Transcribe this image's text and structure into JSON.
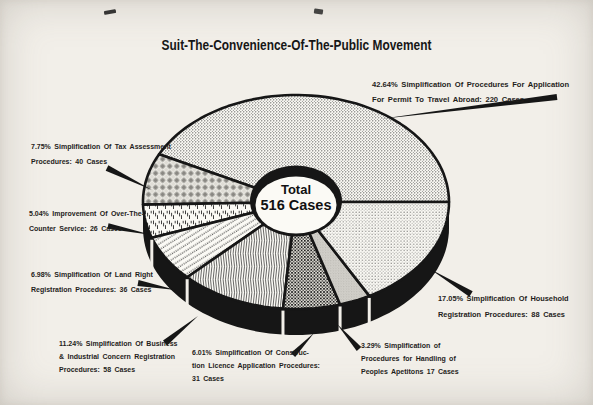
{
  "page": {
    "background": "#f2efe9"
  },
  "chart_data": {
    "type": "pie",
    "title": "Suit-The-Convenience-Of-The-Public Movement",
    "center_label": {
      "line1": "Total",
      "line2": "516 Cases"
    },
    "total_value": 516,
    "units": "Cases",
    "legend_position": "labels-around-pie",
    "colors": {
      "paper": "#f2efe9",
      "pattern_paper": "#fbfaf5",
      "ink": "#161616"
    },
    "geometry": {
      "cx": 296,
      "cy": 202,
      "rx": 153,
      "ry": 107,
      "depth": 26,
      "start_angle": 0,
      "direction": "ccw",
      "hole": {
        "rx_outer": 46,
        "ry_outer": 35.5,
        "rx_inner": 40.5,
        "ry_inner": 28.5
      }
    },
    "slices": [
      {
        "key": "travel-abroad",
        "percent": 42.64,
        "value": 220,
        "label_lines": [
          "42.64% Simplification Of Procedures For Application",
          "For Permit To Travel Abroad: 220 Cases"
        ],
        "pattern": "stipple",
        "label": {
          "x": 372,
          "y": 77,
          "lh": 15,
          "fs": 7.6
        },
        "leader": {
          "tail": [
            557,
            97
          ],
          "tip": [
            380,
            119
          ],
          "w": 3.0
        }
      },
      {
        "key": "tax-assessment",
        "percent": 7.75,
        "value": 40,
        "label_lines": [
          "7.75% Simplification Of Tax Assessment",
          "Procedures: 40 Cases"
        ],
        "pattern": "check",
        "label": {
          "x": 31,
          "y": 139,
          "lh": 15
        },
        "leader": {
          "tail": [
            107,
            168
          ],
          "tip": [
            152,
            190
          ],
          "w": 3.0
        }
      },
      {
        "key": "otc-service",
        "percent": 5.04,
        "value": 26,
        "label_lines": [
          "5.04% Improvement Of Over-The-",
          "Counter Service: 26 Cases"
        ],
        "pattern": "dash",
        "label": {
          "x": 29,
          "y": 206,
          "lh": 15
        },
        "leader": {
          "tail": [
            108,
            226
          ],
          "tip": [
            152,
            235
          ],
          "w": 2.8
        }
      },
      {
        "key": "land-right",
        "percent": 6.98,
        "value": 36,
        "label_lines": [
          "6.98% Simplification Of Land Right",
          "Registration Procedures: 36 Cases"
        ],
        "pattern": "diagdots",
        "label": {
          "x": 31,
          "y": 267,
          "lh": 15
        },
        "leader": {
          "tail": [
            138,
            283
          ],
          "tip": [
            176,
            290
          ],
          "w": 3.0
        }
      },
      {
        "key": "business-registration",
        "percent": 11.24,
        "value": 58,
        "label_lines": [
          "11.24% Simplification Of Business",
          "& Industrial Concern Registration",
          "Procedures: 58 Cases"
        ],
        "pattern": "wavy",
        "label": {
          "x": 59,
          "y": 337,
          "lh": 13
        },
        "leader": {
          "tail": [
            165,
            343
          ],
          "tip": [
            198,
            316
          ],
          "w": 3.2
        }
      },
      {
        "key": "construction-licence",
        "percent": 6.01,
        "value": 31,
        "label_lines": [
          "6.01% Simplification Of Construc-",
          "tion Licence Application Procedures:",
          "31 Cases"
        ],
        "pattern": "grid",
        "label": {
          "x": 192,
          "y": 346,
          "lh": 13
        },
        "leader": {
          "tail": [
            293,
            355
          ],
          "tip": [
            314,
            333
          ],
          "w": 3.0
        }
      },
      {
        "key": "peoples-petitions",
        "percent": 3.29,
        "value": 17,
        "label_lines": [
          "3.29% Simplification of",
          "Procedures for Handling of",
          "Peoples Apetitons 17 Cases"
        ],
        "pattern": "gray",
        "label": {
          "x": 361,
          "y": 339,
          "lh": 13
        },
        "leader": {
          "tail": [
            359,
            349
          ],
          "tip": [
            337,
            324
          ],
          "w": 3.0
        }
      },
      {
        "key": "household-registration",
        "percent": 17.05,
        "value": 88,
        "label_lines": [
          "17.05% Simplification Of Household",
          "Registration Procedures: 88 Cases"
        ],
        "pattern": "stipple2",
        "label": {
          "x": 438,
          "y": 291,
          "lh": 16,
          "fs": 7.4
        },
        "leader": {
          "tail": [
            471,
            294
          ],
          "tip": [
            430,
            269
          ],
          "w": 3.2
        }
      }
    ]
  }
}
